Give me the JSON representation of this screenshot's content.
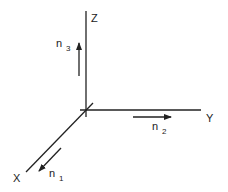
{
  "diagram": {
    "axes": [
      {
        "name": "x-axis",
        "label": "X"
      },
      {
        "name": "y-axis",
        "label": "Y"
      },
      {
        "name": "z-axis",
        "label": "Z"
      }
    ],
    "vectors": [
      {
        "name": "n1",
        "base": "n",
        "subscript": "1",
        "direction": "along X"
      },
      {
        "name": "n2",
        "base": "n",
        "subscript": "2",
        "direction": "along Y"
      },
      {
        "name": "n3",
        "base": "n",
        "subscript": "3",
        "direction": "along Z"
      }
    ],
    "colors": {
      "line": "#222222",
      "background": "#ffffff"
    }
  }
}
